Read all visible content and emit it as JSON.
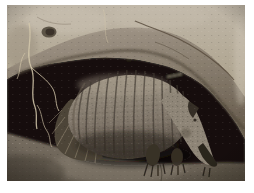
{
  "image": {
    "alt": "An armadillo with a banded armored shell foraging inside a dirt hollow beneath a large tan overhanging rock ledge",
    "type": "photograph",
    "subject": "armadillo",
    "setting": "burrow under a rock overhang with hanging roots and bare earth floor",
    "frame_color": "#ffffff",
    "palette": {
      "frame": "#ffffff",
      "rock_light": "#c7beaf",
      "rock_mid": "#aba08f",
      "rock_shadow": "#74695a",
      "crevice": "#171209",
      "shell_light": "#a2988a",
      "shell_mid": "#877d6f",
      "band_groove": "#403931",
      "head": "#8e8577",
      "snout": "#2b251d",
      "ground_light": "#837a6c",
      "ground_mid": "#6d6457",
      "ground_dark": "#4f4840",
      "hair": "#b5a88d",
      "root": "#d4c8ab"
    }
  }
}
